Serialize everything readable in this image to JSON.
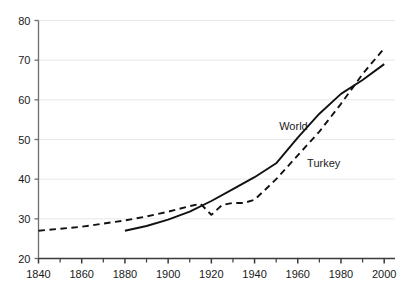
{
  "chart_data": {
    "type": "line",
    "title": "",
    "subtitle": "",
    "xlabel": "",
    "ylabel": "",
    "xlim": [
      1840,
      2005
    ],
    "ylim": [
      20,
      80
    ],
    "grid": true,
    "grid_axis": "y",
    "legend_position": "inline-annotation",
    "x_major_ticks": [
      1840,
      1860,
      1880,
      1900,
      1920,
      1940,
      1960,
      1980,
      2000
    ],
    "x_minor_ticks": [
      1850,
      1870,
      1890,
      1910,
      1930,
      1950,
      1970,
      1990
    ],
    "x_tick_labels": [
      "1840",
      "1860",
      "1880",
      "1900",
      "1920",
      "1940",
      "1960",
      "1980",
      "2000"
    ],
    "y_ticks": [
      20,
      30,
      40,
      50,
      60,
      70,
      80
    ],
    "y_tick_labels": [
      "20",
      "30",
      "40",
      "50",
      "60",
      "70",
      "80"
    ],
    "series": [
      {
        "name": "World",
        "style": "solid",
        "color": "#111111",
        "label_x": 1958,
        "label_y": 52.5,
        "x": [
          1880,
          1890,
          1900,
          1910,
          1920,
          1930,
          1940,
          1950,
          1960,
          1970,
          1980,
          1990,
          2000
        ],
        "values": [
          27.0,
          28.2,
          29.8,
          31.8,
          34.5,
          37.5,
          40.5,
          44.0,
          50.5,
          56.5,
          61.5,
          65.0,
          69.0
        ]
      },
      {
        "name": "Turkey",
        "style": "dashed",
        "color": "#111111",
        "label_x": 1972,
        "label_y": 43.0,
        "x": [
          1840,
          1850,
          1860,
          1870,
          1880,
          1890,
          1900,
          1910,
          1915,
          1920,
          1925,
          1930,
          1935,
          1940,
          1950,
          1960,
          1970,
          1980,
          1990,
          2000
        ],
        "values": [
          27.0,
          27.5,
          28.0,
          28.8,
          29.6,
          30.6,
          31.8,
          33.2,
          33.8,
          31.0,
          33.5,
          34.0,
          34.0,
          34.8,
          40.0,
          46.0,
          52.0,
          59.0,
          66.5,
          73.0
        ]
      }
    ]
  }
}
